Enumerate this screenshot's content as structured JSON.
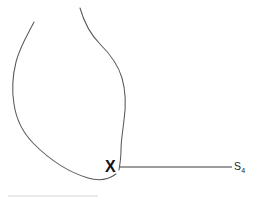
{
  "figure": {
    "title": "",
    "background_color": "#ffffff",
    "width": 259,
    "height": 203,
    "stroke_color": "#58585c",
    "marker": {
      "glyph": "X",
      "name": "x-marker",
      "x": 112,
      "y": 167,
      "color": "#121214"
    },
    "callout": {
      "label_main": "S",
      "label_subscript": "4",
      "label_full": "S4",
      "leader_from_x": 120,
      "leader_to_x": 232,
      "leader_y": 167,
      "color": "#202024"
    },
    "baseline_rule": {
      "from_x": 8,
      "to_x": 98,
      "y": 196,
      "color": "#e2e2e4"
    },
    "outline": {
      "name": "organ-contour",
      "open_ends": [
        {
          "x": 34,
          "y": 22
        },
        {
          "x": 80,
          "y": 8
        }
      ],
      "left_extent_x": 12,
      "right_extent_x": 129,
      "bottom_extent_y": 181,
      "path_left": "M 34 22 C 28 34 20 46 16 62 C 12 78 12 92 14 104 C 16 118 22 132 34 144 C 48 158 68 172 88 178 C 98 181 108 180 116 174",
      "path_right": "M 80 8 C 84 22 90 34 100 44 C 110 54 118 64 122 78 C 126 92 126 106 124 120 C 123 130 121 140 121 150 C 121 158 120 164 119 170"
    }
  }
}
